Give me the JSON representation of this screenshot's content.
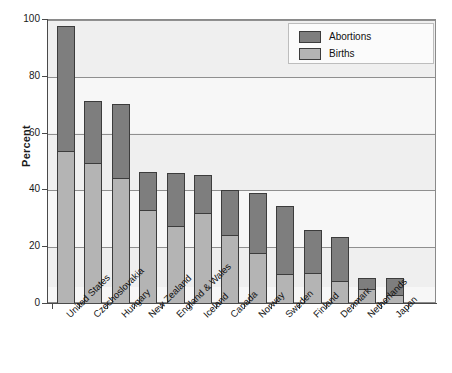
{
  "chart_data": {
    "type": "bar",
    "subtype": "stacked-bar",
    "title": "",
    "xlabel": "",
    "ylabel": "Percent",
    "ylim": [
      0,
      100
    ],
    "yticks": [
      0,
      20,
      40,
      60,
      80,
      100
    ],
    "ytick_labels": [
      "0",
      "20",
      "40",
      "60",
      "80",
      "100"
    ],
    "grid": true,
    "grid_axis": "y",
    "legend_position": "top-right",
    "categories": [
      "United States",
      "Czechoslovakia",
      "Hungary",
      "New Zealand",
      "England & Wales",
      "Iceland",
      "Canada",
      "Norway",
      "Sweden",
      "Finland",
      "Denmark",
      "Netherlands",
      "Japan"
    ],
    "series": [
      {
        "name": "Births",
        "color": "#b4b4b4",
        "values": [
          54,
          49.5,
          44.5,
          33,
          27.5,
          32,
          24,
          18,
          10.5,
          11,
          8,
          5,
          3
        ]
      },
      {
        "name": "Abortions",
        "color": "#7e7e7e",
        "values": [
          44,
          22,
          26,
          13.5,
          18.5,
          13.5,
          16,
          21,
          24,
          15,
          15.5,
          4,
          6
        ]
      }
    ],
    "totals": [
      98,
      71.5,
      70.5,
      46.5,
      46,
      45.5,
      40,
      39,
      34.5,
      26,
      23.5,
      9,
      9
    ]
  },
  "legend": {
    "items": [
      {
        "label": "Abortions",
        "color": "#7e7e7e"
      },
      {
        "label": "Births",
        "color": "#b4b4b4"
      }
    ]
  },
  "axis": {
    "y_title": "Percent"
  }
}
